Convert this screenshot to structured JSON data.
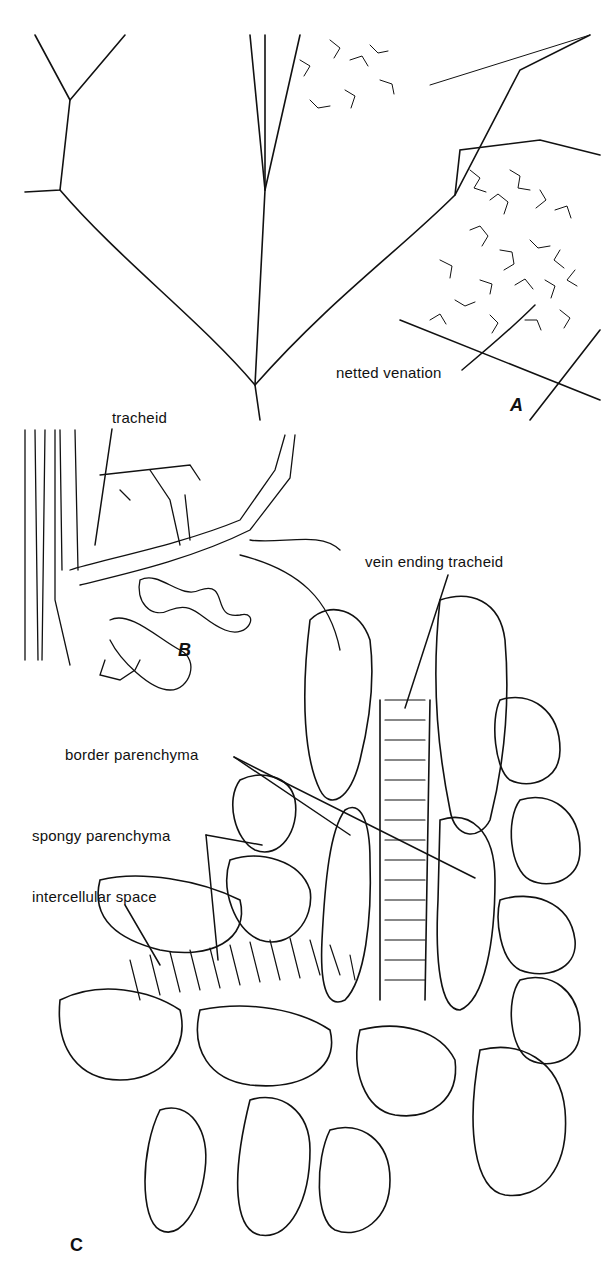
{
  "figure": {
    "panels": [
      {
        "id": "A",
        "label": "A",
        "description": "leaf venation with netted venation"
      },
      {
        "id": "B",
        "label": "B",
        "description": "tracheids of vein ending"
      },
      {
        "id": "C",
        "label": "C",
        "description": "cellular detail of vein ending"
      }
    ],
    "labels": {
      "netted_venation": "netted venation",
      "tracheid": "tracheid",
      "vein_ending_tracheid": "vein ending tracheid",
      "border_parenchyma": "border parenchyma",
      "spongy_parenchyma": "spongy parenchyma",
      "intercellular_space": "intercellular space"
    },
    "colors": {
      "ink": "#111111",
      "background": "#ffffff"
    }
  }
}
